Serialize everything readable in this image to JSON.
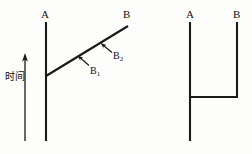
{
  "figure": {
    "width": 252,
    "height": 154,
    "background_color": "#fdfdfc",
    "stroke_color": "#1a1a1a",
    "text_color": "#111111"
  },
  "axis": {
    "time_label": "时间",
    "time_label_meaning": "time",
    "arrow_direction": "up",
    "arrow_x": 25,
    "arrow_top_y": 55,
    "arrow_bottom_y": 141
  },
  "left_diagram": {
    "name": "diagram-left",
    "worldline_a": {
      "label": "A",
      "x": 46,
      "y_top": 22,
      "y_bottom": 141
    },
    "worldline_b": {
      "label": "B",
      "type": "diagonal",
      "x_start": 46,
      "y_start": 76,
      "x_end": 128,
      "y_end": 26
    },
    "callouts": [
      {
        "label": "B",
        "subscript": "1",
        "text": "B₁",
        "label_x": 90,
        "label_y": 66,
        "arrow_from_x": 90,
        "arrow_from_y": 66,
        "arrow_to_x": 78,
        "arrow_to_y": 56
      },
      {
        "label": "B",
        "subscript": "2",
        "text": "B₂",
        "label_x": 113,
        "label_y": 51,
        "arrow_from_x": 113,
        "arrow_from_y": 52,
        "arrow_to_x": 101,
        "arrow_to_y": 43
      }
    ]
  },
  "right_diagram": {
    "name": "diagram-right",
    "worldline_a": {
      "label": "A",
      "x": 190,
      "y_top": 22,
      "y_bottom": 141
    },
    "worldline_b": {
      "label": "B",
      "x": 237,
      "y_top": 22,
      "y_bottom": 97
    },
    "connector": {
      "y": 97,
      "x_start": 190,
      "x_end": 237
    }
  }
}
